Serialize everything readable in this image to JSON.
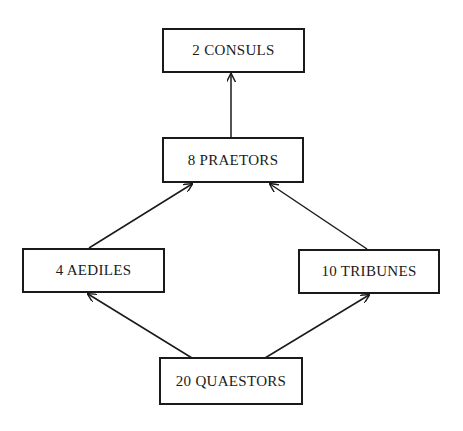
{
  "diagram": {
    "type": "flowchart",
    "colors": {
      "stroke": "#1a1a1a",
      "background": "#ffffff"
    },
    "nodes": [
      {
        "id": "consuls",
        "label": "2  CONSULS",
        "box": [
          162,
          28,
          143,
          45
        ]
      },
      {
        "id": "praetors",
        "label": "8  PRAETORS",
        "box": [
          162,
          137,
          142,
          46
        ]
      },
      {
        "id": "aediles",
        "label": "4  AEDILES",
        "box": [
          22,
          248,
          143,
          45
        ]
      },
      {
        "id": "tribunes",
        "label": "10  TRIBUNES",
        "box": [
          298,
          249,
          142,
          45
        ]
      },
      {
        "id": "quaestors",
        "label": "20  QUAESTORS",
        "box": [
          159,
          357,
          144,
          48
        ]
      }
    ],
    "edges": [
      {
        "from": "quaestors",
        "to": "aediles",
        "start": [
          192,
          358
        ],
        "end": [
          88,
          294
        ]
      },
      {
        "from": "quaestors",
        "to": "tribunes",
        "start": [
          265,
          358
        ],
        "end": [
          369,
          295
        ]
      },
      {
        "from": "aediles",
        "to": "praetors",
        "start": [
          89,
          248
        ],
        "end": [
          192,
          184
        ]
      },
      {
        "from": "tribunes",
        "to": "praetors",
        "start": [
          367,
          249
        ],
        "end": [
          270,
          184
        ]
      },
      {
        "from": "praetors",
        "to": "consuls",
        "start": [
          231,
          137
        ],
        "end": [
          231,
          74
        ]
      }
    ]
  }
}
